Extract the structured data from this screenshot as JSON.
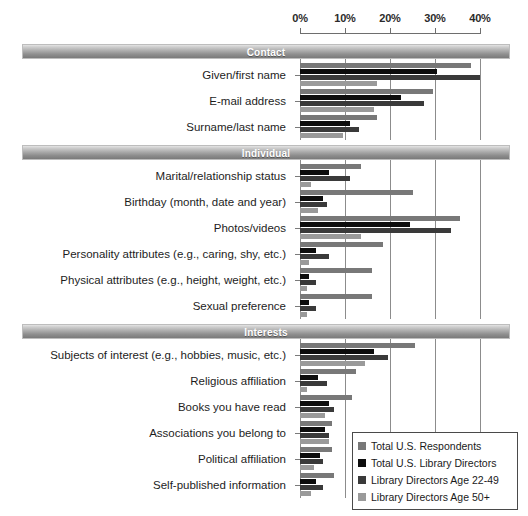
{
  "top_sliver_text": "",
  "legend": {
    "position": "bottom-right",
    "items": [
      {
        "label": "Total U.S. Respondents",
        "color": "#787878"
      },
      {
        "label": "Total U.S. Library Directors",
        "color": "#0d0d0d"
      },
      {
        "label": "Library Directors Age 22-49",
        "color": "#3a3a3a"
      },
      {
        "label": "Library Directors Age 50+",
        "color": "#9a9a9a"
      }
    ]
  },
  "axis": {
    "ticks": [
      "0%",
      "10%",
      "20%",
      "30%",
      "40%"
    ],
    "tick_values": [
      0,
      10,
      20,
      30,
      40
    ]
  },
  "sections": [
    {
      "title": "Contact"
    },
    {
      "title": "Individual"
    },
    {
      "title": "Interests"
    }
  ],
  "chart_data": {
    "type": "bar",
    "orientation": "horizontal",
    "title": "",
    "xlabel": "",
    "ylabel": "",
    "xlim": [
      0,
      40
    ],
    "xticks": [
      0,
      10,
      20,
      30,
      40
    ],
    "xtick_labels": [
      "0%",
      "10%",
      "20%",
      "30%",
      "40%"
    ],
    "grid": "vertical",
    "legend_position": "bottom-right",
    "series_names": [
      "Total U.S. Respondents",
      "Total U.S. Library Directors",
      "Library Directors Age 22-49",
      "Library Directors Age 50+"
    ],
    "series_colors": [
      "#787878",
      "#0d0d0d",
      "#3a3a3a",
      "#9a9a9a"
    ],
    "groups": [
      {
        "name": "Contact",
        "categories": [
          "Given/first name",
          "E-mail address",
          "Surname/last name"
        ],
        "series": [
          {
            "name": "Total U.S. Respondents",
            "values": [
              38.0,
              29.5,
              17.0
            ]
          },
          {
            "name": "Total U.S. Library Directors",
            "values": [
              30.5,
              22.5,
              11.0
            ]
          },
          {
            "name": "Library Directors Age 22-49",
            "values": [
              40.0,
              27.5,
              13.0
            ]
          },
          {
            "name": "Library Directors Age 50+",
            "values": [
              17.0,
              16.5,
              9.5
            ]
          }
        ]
      },
      {
        "name": "Individual",
        "categories": [
          "Marital/relationship status",
          "Birthday (month, date and year)",
          "Photos/videos",
          "Personality attributes (e.g., caring, shy, etc.)",
          "Physical attributes (e.g., height, weight, etc.)",
          "Sexual preference"
        ],
        "series": [
          {
            "name": "Total U.S. Respondents",
            "values": [
              13.5,
              25.0,
              35.5,
              18.5,
              16.0,
              16.0
            ]
          },
          {
            "name": "Total U.S. Library Directors",
            "values": [
              6.5,
              5.0,
              24.5,
              3.5,
              2.0,
              2.0
            ]
          },
          {
            "name": "Library Directors Age 22-49",
            "values": [
              11.0,
              6.0,
              33.5,
              6.5,
              3.5,
              3.5
            ]
          },
          {
            "name": "Library Directors Age 50+",
            "values": [
              2.5,
              4.0,
              13.5,
              2.0,
              1.5,
              1.5
            ]
          }
        ]
      },
      {
        "name": "Interests",
        "categories": [
          "Subjects of interest (e.g., hobbies, music, etc.)",
          "Religious affiliation",
          "Books you have read",
          "Associations you belong to",
          "Political affiliation",
          "Self-published information"
        ],
        "series": [
          {
            "name": "Total U.S. Respondents",
            "values": [
              25.5,
              12.5,
              11.5,
              7.0,
              7.0,
              7.5
            ]
          },
          {
            "name": "Total U.S. Library Directors",
            "values": [
              16.5,
              4.0,
              6.5,
              5.5,
              4.5,
              3.5
            ]
          },
          {
            "name": "Library Directors Age 22-49",
            "values": [
              19.5,
              6.0,
              7.5,
              6.5,
              5.0,
              5.0
            ]
          },
          {
            "name": "Library Directors Age 50+",
            "values": [
              14.5,
              1.5,
              5.5,
              6.5,
              3.0,
              2.5
            ]
          }
        ]
      }
    ]
  }
}
